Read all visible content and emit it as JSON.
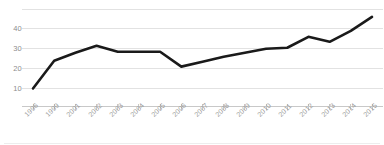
{
  "chart_data": {
    "type": "line",
    "title": "",
    "subtitle": "",
    "xlabel": "",
    "ylabel": "",
    "categories": [
      "1996",
      "1999",
      "2001",
      "2002",
      "2003",
      "2004",
      "2005",
      "2006",
      "2007",
      "2008",
      "2009",
      "2010",
      "2011",
      "2012",
      "2013",
      "2014",
      "2015"
    ],
    "values": [
      10,
      24,
      28,
      31.5,
      28.5,
      28.5,
      28.5,
      21,
      23.5,
      26,
      28,
      30,
      30.5,
      36,
      33.5,
      39,
      46
    ],
    "series": [
      {
        "name": "",
        "values": [
          10,
          24,
          28,
          31.5,
          28.5,
          28.5,
          28.5,
          21,
          23.5,
          26,
          28,
          30,
          30.5,
          36,
          33.5,
          39,
          46
        ]
      }
    ],
    "ylim": [
      0,
      50
    ],
    "xlim": [
      0,
      16
    ],
    "yticks": [
      10,
      20,
      30,
      40
    ],
    "ytick_labels": [
      "10",
      "20",
      "30",
      "40"
    ],
    "gridlines": [
      10,
      20,
      30,
      40,
      50
    ],
    "grid": true,
    "grid_axis": "y",
    "legend": false,
    "legend_position": "none",
    "line_color": "#1a1a1a",
    "grid_color": "#e2e2e2",
    "axis_color": "#c8c8c8",
    "tick_label_color": "#9a9a9a",
    "background": "#ffffff",
    "line_width": 2.6,
    "annotations": []
  },
  "axes": {
    "y_tick_labels": [
      "40",
      "30",
      "20",
      "10"
    ],
    "x_tick_labels": [
      "1996",
      "1999",
      "2001",
      "2002",
      "2003",
      "2004",
      "2005",
      "2006",
      "2007",
      "2008",
      "2009",
      "2010",
      "2011",
      "2012",
      "2013",
      "2014",
      "2015"
    ]
  }
}
